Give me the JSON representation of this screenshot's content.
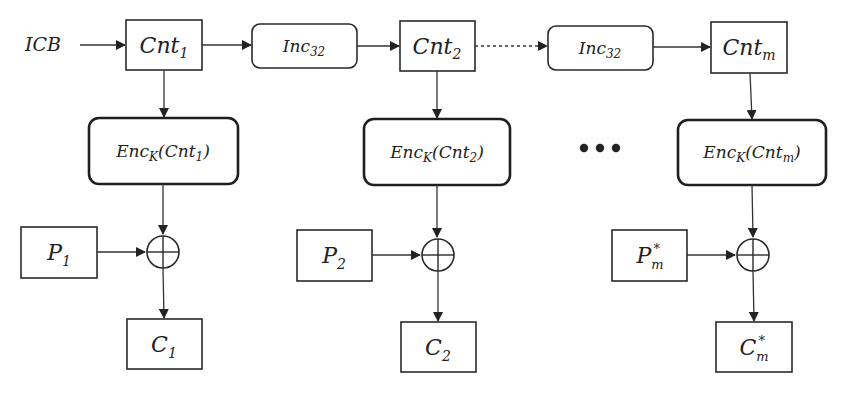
{
  "diagram": {
    "type": "block-diagram",
    "colors": {
      "stroke": "#2a2a2a",
      "text": "#222222",
      "background": "#ffffff"
    },
    "input": {
      "label": "ICB"
    },
    "counters": [
      {
        "base": "Cnt",
        "sub": "1"
      },
      {
        "base": "Cnt",
        "sub": "2"
      },
      {
        "base": "Cnt",
        "sub": "m"
      }
    ],
    "increments": [
      {
        "base": "Inc",
        "sub": "32"
      },
      {
        "base": "Inc",
        "sub": "32"
      }
    ],
    "encryptions": [
      {
        "base": "Enc",
        "key": "K",
        "open": "(",
        "arg": "Cnt",
        "arg_sub": "1",
        "close": ")"
      },
      {
        "base": "Enc",
        "key": "K",
        "open": "(",
        "arg": "Cnt",
        "arg_sub": "2",
        "close": ")"
      },
      {
        "base": "Enc",
        "key": "K",
        "open": "(",
        "arg": "Cnt",
        "arg_sub": "m",
        "close": ")"
      }
    ],
    "plaintexts": [
      {
        "base": "P",
        "sub": "1",
        "sup": ""
      },
      {
        "base": "P",
        "sub": "2",
        "sup": ""
      },
      {
        "base": "P",
        "sub": "m",
        "sup": "*"
      }
    ],
    "ciphertexts": [
      {
        "base": "C",
        "sub": "1",
        "sup": ""
      },
      {
        "base": "C",
        "sub": "2",
        "sup": ""
      },
      {
        "base": "C",
        "sub": "m",
        "sup": "*"
      }
    ],
    "ellipsis": "•••",
    "xor_symbol": "xor-circle-plus"
  }
}
